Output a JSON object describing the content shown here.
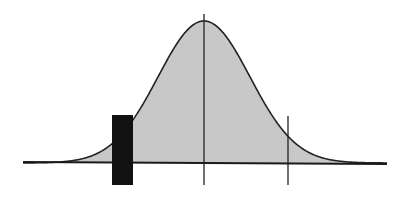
{
  "diagram": {
    "type": "normal-distribution",
    "width": 408,
    "height": 202,
    "colors": {
      "background": "#ffffff",
      "curve_fill": "#c8c8c8",
      "curve_stroke": "#222222",
      "axis": "#1a1a1a",
      "marker_block": "#111111"
    },
    "curve": {
      "mean_x": 204,
      "peak_y": 21,
      "baseline_y": 163,
      "sigma_px": 46,
      "x_start": 23,
      "x_end": 387
    },
    "baseline": {
      "x1": 23,
      "y1": 162,
      "x2": 387,
      "y2": 164
    },
    "mean_line": {
      "x": 204,
      "y1": 14,
      "y2": 185
    },
    "right_marker_line": {
      "x": 288,
      "y1": 116,
      "y2": 185
    },
    "left_marker_block": {
      "x": 112,
      "y": 115,
      "width": 21,
      "height": 70
    }
  }
}
